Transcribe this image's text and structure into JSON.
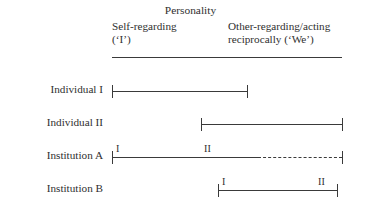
{
  "figure": {
    "width": 381,
    "height": 208,
    "background": "#ffffff",
    "ink": "#3a3a3a",
    "text_color": "#2f2f2f"
  },
  "header": {
    "title": "Personality",
    "columns": [
      {
        "label": "Self-regarding\n(‘I’)"
      },
      {
        "label": "Other-regarding/acting\nreciprocally (‘We’)"
      }
    ]
  },
  "chart_data": {
    "type": "bar",
    "title": "Personality",
    "xlabel": "",
    "ylabel": "",
    "axis_tick_labels": [
      "Self-regarding (‘I’)",
      "Other-regarding/acting reciprocally (‘We’)"
    ],
    "categories": [
      "Individual I",
      "Individual II",
      "Institution A",
      "Institution B"
    ],
    "rows": [
      {
        "label": "Individual I",
        "start": 112,
        "end": 247,
        "solid_end": 247,
        "dashed": false,
        "annotations": []
      },
      {
        "label": "Individual II",
        "start": 201,
        "end": 342,
        "solid_end": 342,
        "dashed": false,
        "annotations": []
      },
      {
        "label": "Institution A",
        "start": 112,
        "end": 342,
        "solid_end": 258,
        "dashed": true,
        "annotations": [
          {
            "text": "I",
            "x": 116
          },
          {
            "text": "II",
            "x": 204
          }
        ]
      },
      {
        "label": "Institution B",
        "start": 218,
        "end": 337,
        "solid_end": 337,
        "dashed": false,
        "annotations": [
          {
            "text": "I",
            "x": 222
          },
          {
            "text": "II",
            "x": 318
          }
        ]
      }
    ]
  }
}
